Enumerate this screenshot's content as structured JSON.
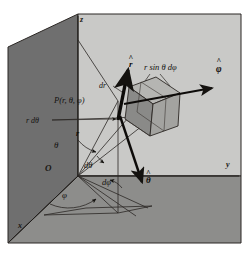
{
  "figure": {
    "background_color": "#ffffff"
  },
  "panels": {
    "left_wall": {
      "name": "left-wall",
      "color": "#6f6f6f"
    },
    "back_wall": {
      "name": "back-wall",
      "color": "#c9c9c7"
    },
    "floor": {
      "name": "floor",
      "color": "#8d8d8b"
    },
    "outline_color": "#2b2724"
  },
  "axes": {
    "z": {
      "label": "z",
      "x": 80,
      "y": 22
    },
    "y": {
      "label": "y",
      "x": 226,
      "y": 167
    },
    "x": {
      "label": "x",
      "x": 18,
      "y": 228
    },
    "origin": {
      "label": "O",
      "x": 45,
      "y": 171
    }
  },
  "labels": {
    "point": {
      "text": "P(r, θ, φ)",
      "x": 54,
      "y": 103
    },
    "r_dtheta": {
      "text": "r dθ",
      "x": 31,
      "y": 123
    },
    "dr": {
      "text": "dr",
      "x": 104,
      "y": 88
    },
    "r_sin_theta_dphi": {
      "text": "r sin θ dφ",
      "x": 144,
      "y": 69
    },
    "r": {
      "text": "r",
      "x": 78,
      "y": 135
    },
    "theta": {
      "text": "θ",
      "x": 57,
      "y": 147
    },
    "d_theta": {
      "text": "dθ",
      "x": 86,
      "y": 167
    },
    "d_phi": {
      "text": "dφ",
      "x": 104,
      "y": 184
    },
    "phi": {
      "text": "φ",
      "x": 64,
      "y": 197
    }
  },
  "unit_vectors": {
    "r_hat": {
      "label": "r",
      "hat": "^",
      "x": 131,
      "y": 66,
      "tip_x": 122,
      "tip_y": 72
    },
    "phi_hat": {
      "label": "φ",
      "hat": "^",
      "x": 220,
      "y": 71,
      "tip_x": 214,
      "tip_y": 91
    },
    "theta_hat": {
      "label": "θ",
      "hat": "^",
      "x": 148,
      "y": 182,
      "tip_x": 139,
      "tip_y": 186
    }
  },
  "volume_element": {
    "name": "differential-volume-cube",
    "face_front_color": "#8a8a88",
    "face_top_color": "#b5b5b2",
    "face_side_color": "#a3a3a0",
    "edge_color": "#2b2724"
  }
}
